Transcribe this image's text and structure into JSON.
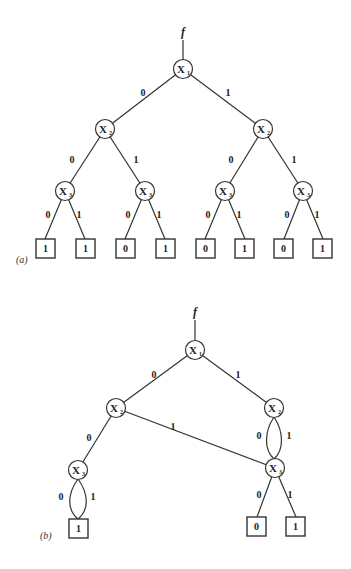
{
  "diagram_a": {
    "caption": "(a)",
    "function_label": "f",
    "nodes": [
      {
        "id": "x1",
        "var": "X",
        "sub": "1"
      },
      {
        "id": "x2l",
        "var": "X",
        "sub": "2"
      },
      {
        "id": "x2r",
        "var": "X",
        "sub": "2"
      },
      {
        "id": "x3a",
        "var": "X",
        "sub": "3"
      },
      {
        "id": "x3b",
        "var": "X",
        "sub": "3"
      },
      {
        "id": "x3c",
        "var": "X",
        "sub": "3"
      },
      {
        "id": "x3d",
        "var": "X",
        "sub": "3"
      }
    ],
    "edge_labels": {
      "x1_0": "0",
      "x1_1": "1",
      "x2l_0": "0",
      "x2l_1": "1",
      "x2r_0": "0",
      "x2r_1": "1",
      "x3a_0": "0",
      "x3a_1": "1",
      "x3b_0": "0",
      "x3b_1": "1",
      "x3c_0": "0",
      "x3c_1": "1",
      "x3d_0": "0",
      "x3d_1": "1"
    },
    "leaves": [
      "1",
      "1",
      "0",
      "1",
      "0",
      "1",
      "0",
      "1"
    ]
  },
  "diagram_b": {
    "caption": "(b)",
    "function_label": "f",
    "nodes": [
      {
        "id": "x1",
        "var": "X",
        "sub": "1"
      },
      {
        "id": "x2l",
        "var": "X",
        "sub": "2"
      },
      {
        "id": "x2r",
        "var": "X",
        "sub": "2"
      },
      {
        "id": "x3l",
        "var": "X",
        "sub": "3"
      },
      {
        "id": "x3r",
        "var": "X",
        "sub": "3"
      }
    ],
    "edge_labels": {
      "x1_0": "0",
      "x1_1": "1",
      "x2l_0": "0",
      "x2l_1": "1",
      "x2r_0": "0",
      "x2r_1": "1",
      "x3l_0": "0",
      "x3l_1": "1",
      "x3r_0": "0",
      "x3r_1": "1"
    },
    "leaves": [
      "1",
      "0",
      "1"
    ]
  }
}
